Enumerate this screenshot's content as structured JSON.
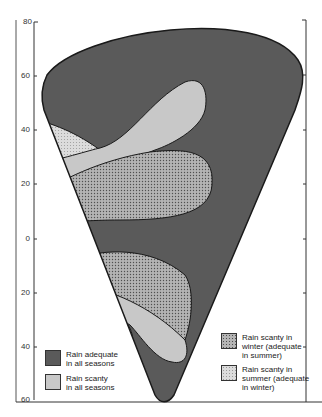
{
  "diagram": {
    "axis": {
      "left_labels": [
        "80",
        "60",
        "40",
        "20",
        "0",
        "20",
        "40",
        "60"
      ],
      "right_labels": []
    },
    "colors": {
      "adequate_all": "#5a5a5a",
      "scanty_all": "#c8c8c8",
      "stipple_bg": "#b4b4b4",
      "stipple_dot": "#505050",
      "light_stipple_bg": "#dcdcdc",
      "light_stipple_dot": "#9a9a9a",
      "outline": "#1a1a1a"
    },
    "legend": [
      {
        "id": "adequate_all",
        "label": "Rain adequate\nin all seasons"
      },
      {
        "id": "scanty_all",
        "label": "Rain  scanty\nin all seasons"
      },
      {
        "id": "scanty_winter",
        "label": "Rain scanty in\nwinter  (adequate\nin summer)"
      },
      {
        "id": "scanty_summer",
        "label": "Rain scanty in\nsummer (adequate\nin winter)"
      }
    ]
  }
}
